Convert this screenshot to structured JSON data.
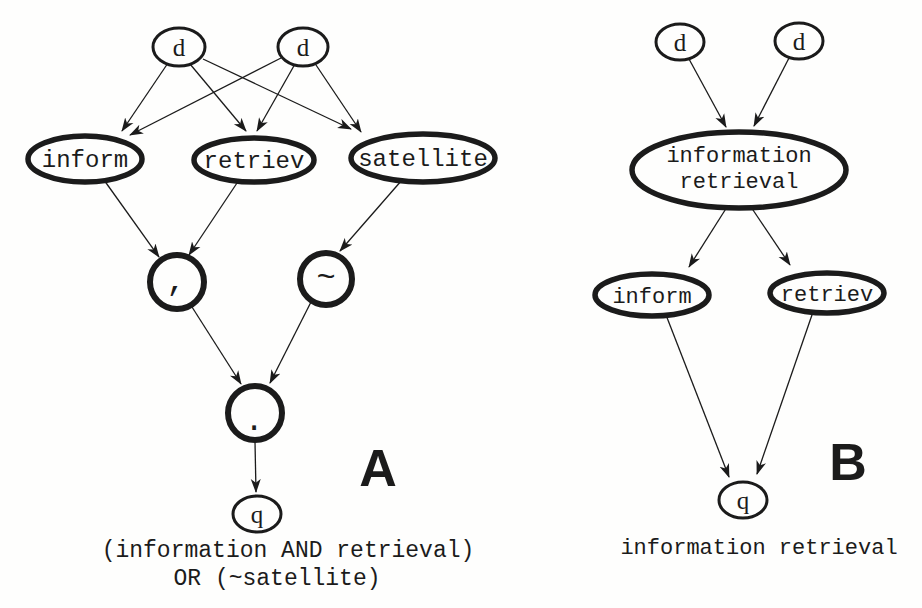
{
  "figure": {
    "ink_color": "#1b1b1b",
    "background_color": "#fefefd",
    "panel_a": {
      "label": "A",
      "caption_line1": "(information AND retrieval)",
      "caption_line2": "OR (~satellite)",
      "nodes": {
        "doc1": "d",
        "doc2": "d",
        "term_inform": "inform",
        "term_retriev": "retriev",
        "term_satellite": "satellite",
        "op_and": ",",
        "op_not": "~",
        "op_or": ".",
        "query": "q"
      }
    },
    "panel_b": {
      "label": "B",
      "caption": "information retrieval",
      "nodes": {
        "doc1": "d",
        "doc2": "d",
        "concept_line1": "information",
        "concept_line2": "retrieval",
        "term_inform": "inform",
        "term_retriev": "retriev",
        "query": "q"
      }
    }
  }
}
